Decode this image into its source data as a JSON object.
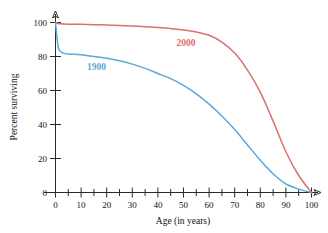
{
  "chart_data": {
    "type": "line",
    "title": "",
    "xlabel": "Age (in years)",
    "ylabel": "Percent surviving",
    "xlim": [
      0,
      100
    ],
    "ylim": [
      0,
      100
    ],
    "xticks": [
      0,
      10,
      20,
      30,
      40,
      50,
      60,
      70,
      80,
      90,
      100
    ],
    "xminorticks": [
      5,
      15,
      25,
      35,
      45,
      55,
      65,
      75,
      85,
      95
    ],
    "yticks": [
      0,
      20,
      40,
      60,
      80,
      100
    ],
    "xtick_labels": [
      "0",
      "10",
      "20",
      "30",
      "40",
      "50",
      "60",
      "70",
      "80",
      "90",
      "100"
    ],
    "ytick_labels": [
      "0",
      "20",
      "40",
      "60",
      "80",
      "100"
    ],
    "grid": false,
    "legend_position": "inline-annotations",
    "x": [
      0,
      1,
      2,
      3,
      5,
      10,
      15,
      20,
      25,
      30,
      35,
      40,
      45,
      50,
      55,
      60,
      65,
      70,
      75,
      80,
      85,
      90,
      95,
      100
    ],
    "series": [
      {
        "name": "1900",
        "color": "#5aa9d6",
        "label_x": 16,
        "label_y": 72,
        "values": [
          100,
          86,
          83,
          82,
          81.5,
          81,
          80,
          79,
          77.5,
          75.5,
          73,
          70,
          67,
          63,
          58,
          52,
          45,
          37,
          28,
          19,
          11,
          5,
          2,
          0
        ]
      },
      {
        "name": "2000",
        "color": "#d9726a",
        "label_x": 51,
        "label_y": 86,
        "values": [
          100,
          99.4,
          99.2,
          99.1,
          99,
          98.9,
          98.7,
          98.5,
          98.2,
          97.9,
          97.5,
          97,
          96.4,
          95.6,
          94.4,
          92.5,
          88.5,
          82,
          72,
          59,
          42,
          24,
          10,
          0
        ]
      }
    ]
  }
}
